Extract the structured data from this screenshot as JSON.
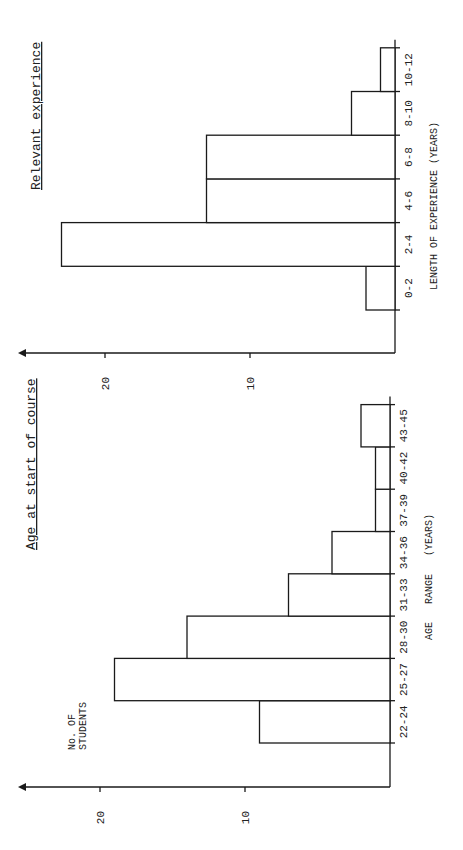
{
  "chart_data": [
    {
      "type": "bar",
      "title": "Age at start of course",
      "xlabel": "AGE   RANGE   (YEARS)",
      "ylabel": "No. OF STUDENTS",
      "categories": [
        "22-24",
        "25-27",
        "28-30",
        "31-33",
        "34-36",
        "37-39",
        "40-42",
        "43-45"
      ],
      "values": [
        9,
        19,
        14,
        7,
        4,
        1,
        1,
        2
      ],
      "yticks": [
        10,
        20
      ],
      "ylim": [
        0,
        22
      ],
      "grid": false,
      "orientation": "rotated 90 degrees counter-clockwise"
    },
    {
      "type": "bar",
      "title": "Relevant experience",
      "xlabel": "LENGTH OF EXPERIENCE (YEARS)",
      "ylabel": "",
      "categories": [
        "0-2",
        "2-4",
        "4-6",
        "6-8",
        "8-10",
        "10-12"
      ],
      "values": [
        2,
        23,
        13,
        13,
        3,
        1
      ],
      "yticks": [
        10,
        20
      ],
      "ylim": [
        0,
        24
      ],
      "grid": false,
      "orientation": "rotated 90 degrees counter-clockwise"
    }
  ]
}
